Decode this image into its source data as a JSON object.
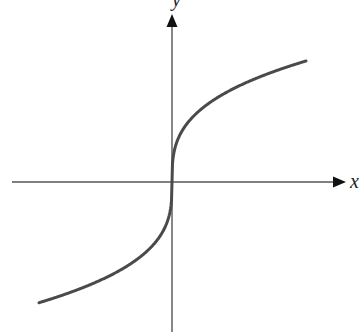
{
  "chart_data": {
    "type": "line",
    "title": "",
    "function": "y = cbrt(x)",
    "xlabel": "x",
    "ylabel": "y",
    "grid": false,
    "legend": null,
    "ticks": {
      "x": [],
      "y": []
    },
    "xlim": [
      -5.6,
      7.3
    ],
    "ylim": [
      -6.4,
      7.1
    ],
    "series": [
      {
        "name": "curve",
        "x": [
          -5.62,
          -4.0,
          -2.0,
          -1.0,
          -0.5,
          -0.1,
          0,
          0.1,
          0.5,
          1.0,
          2.0,
          4.0,
          5.67
        ],
        "values": [
          -1.78,
          -1.59,
          -1.26,
          -1.0,
          -0.79,
          -0.46,
          0,
          0.46,
          0.79,
          1.0,
          1.26,
          1.59,
          1.78
        ]
      }
    ]
  },
  "figure": {
    "x_axis_label": "x",
    "y_axis_label": "y",
    "curve_color": "#4a4a4a",
    "axis_color": "#555555",
    "background": "#ffffff"
  }
}
